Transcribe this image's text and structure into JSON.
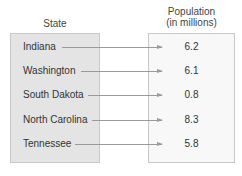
{
  "headers": {
    "domain": "State",
    "range_line1": "Population",
    "range_line2": "(in millions)"
  },
  "mapping": [
    {
      "state": "Indiana",
      "population": "6.2"
    },
    {
      "state": "Washington",
      "population": "6.1"
    },
    {
      "state": "South Dakota",
      "population": "0.8"
    },
    {
      "state": "North Carolina",
      "population": "8.3"
    },
    {
      "state": "Tennessee",
      "population": "5.8"
    }
  ],
  "colors": {
    "domain_box": "#e4e4e4",
    "range_box": "#f8f8f8",
    "arrow": "#9a9a9a"
  }
}
